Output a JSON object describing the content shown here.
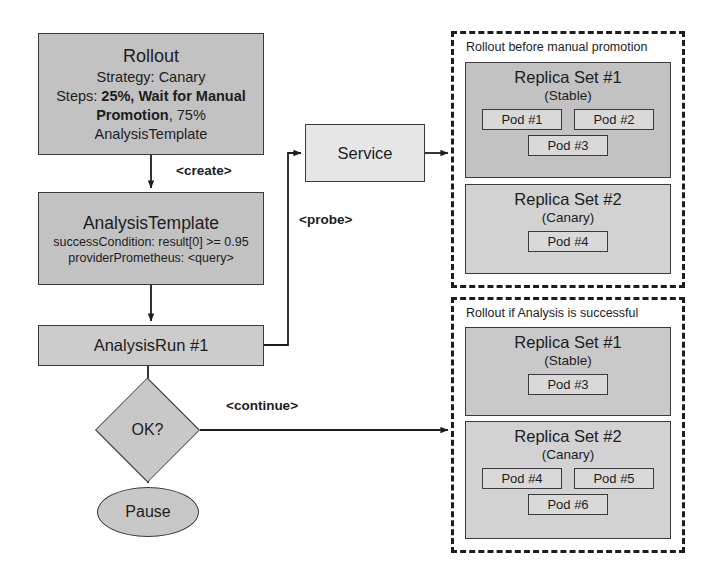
{
  "nodes": {
    "rollout": {
      "name": "Rollout",
      "strategy": "Strategy: Canary",
      "steps_prefix": "Steps: ",
      "steps_bold_1": "25%, Wait for Manual",
      "steps_bold_2": "Promotion",
      "steps_suffix": ", 75%",
      "template_ref": "AnalysisTemplate"
    },
    "analysis_template": {
      "name": "AnalysisTemplate",
      "success_condition": "successCondition: result[0] >= 0.95",
      "provider": "providerPrometheus: <query>"
    },
    "analysis_run": {
      "name": "AnalysisRun #1"
    },
    "decision": {
      "label": "OK?"
    },
    "pause": {
      "label": "Pause"
    },
    "service": {
      "label": "Service"
    }
  },
  "edges": {
    "create": "<create>",
    "probe": "<probe>",
    "continue": "<continue>"
  },
  "regions": {
    "before": {
      "title": "Rollout before manual promotion",
      "replica_sets": [
        {
          "name": "Replica Set #1",
          "role": "(Stable)",
          "pod_rows": [
            [
              "Pod #1",
              "Pod #2"
            ],
            [
              "Pod #3"
            ]
          ]
        },
        {
          "name": "Replica Set #2",
          "role": "(Canary)",
          "pod_rows": [
            [
              "Pod #4"
            ]
          ]
        }
      ]
    },
    "after": {
      "title": "Rollout if Analysis is successful",
      "replica_sets": [
        {
          "name": "Replica Set #1",
          "role": "(Stable)",
          "pod_rows": [
            [
              "Pod #3"
            ]
          ]
        },
        {
          "name": "Replica Set #2",
          "role": "(Canary)",
          "pod_rows": [
            [
              "Pod #4",
              "Pod #5"
            ],
            [
              "Pod #6"
            ]
          ]
        }
      ]
    }
  },
  "colors": {
    "line": "#1d1d1d",
    "node_fill_dark": "#c2c2c2",
    "node_fill_mid": "#cccccc",
    "node_fill_light": "#e6e6e6",
    "pod_fill": "#d9d9d9"
  }
}
